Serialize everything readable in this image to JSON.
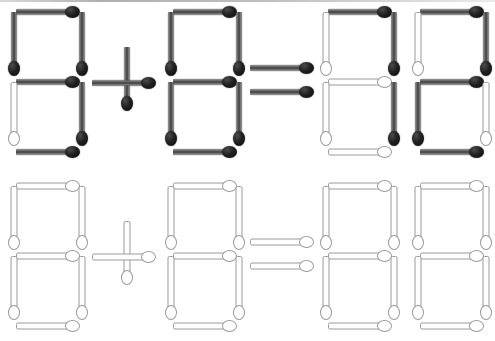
{
  "scene": {
    "title": "Matchstick arithmetic puzzle",
    "width": 495,
    "height": 341,
    "background": "#ffffff",
    "colors": {
      "lit_stick": "#3e3e3e",
      "lit_head": "#0a0a0a",
      "unlit_stick": "#ffffff",
      "unlit_outline": "#9a9a9a"
    },
    "rows": [
      {
        "name": "equation-row",
        "label": "lit equation",
        "state": "lit"
      },
      {
        "name": "blank-row",
        "label": "unlit template",
        "state": "unlit"
      }
    ],
    "equation": {
      "expression": "9 + 8 = 3 2",
      "left_operand": "9",
      "operator": "+",
      "right_operand": "8",
      "equals": "=",
      "result": "32"
    }
  },
  "geometry": {
    "seg_len": 62,
    "stick_thickness": 7,
    "head_len": 15
  },
  "digits": [
    {
      "name": "digit-1",
      "row": "top",
      "value": "9",
      "x": 10,
      "y": 8,
      "segments": {
        "top": "lit",
        "top_left": "lit",
        "top_right": "lit",
        "middle": "lit",
        "bottom_left": "unlit",
        "bottom_right": "lit",
        "bottom": "lit"
      }
    },
    {
      "name": "digit-2",
      "row": "top",
      "value": "8",
      "x": 167,
      "y": 8,
      "segments": {
        "top": "lit",
        "top_left": "lit",
        "top_right": "lit",
        "middle": "lit",
        "bottom_left": "lit",
        "bottom_right": "lit",
        "bottom": "lit"
      }
    },
    {
      "name": "digit-3",
      "row": "top",
      "value": "3",
      "x": 322,
      "y": 8,
      "segments": {
        "top": "lit",
        "top_left": "unlit",
        "top_right": "lit",
        "middle": "unlit",
        "bottom_left": "unlit",
        "bottom_right": "lit",
        "bottom": "unlit"
      }
    },
    {
      "name": "digit-4",
      "row": "top",
      "value": "2",
      "x": 414,
      "y": 8,
      "segments": {
        "top": "lit",
        "top_left": "unlit",
        "top_right": "lit",
        "middle": "lit",
        "bottom_left": "lit",
        "bottom_right": "unlit",
        "bottom": "lit"
      }
    },
    {
      "name": "digit-5",
      "row": "bottom",
      "value": "blank",
      "x": 10,
      "y": 182,
      "segments": {
        "top": "unlit",
        "top_left": "unlit",
        "top_right": "unlit",
        "middle": "unlit",
        "bottom_left": "unlit",
        "bottom_right": "unlit",
        "bottom": "unlit"
      }
    },
    {
      "name": "digit-6",
      "row": "bottom",
      "value": "blank",
      "x": 167,
      "y": 182,
      "segments": {
        "top": "unlit",
        "top_left": "unlit",
        "top_right": "unlit",
        "middle": "unlit",
        "bottom_left": "unlit",
        "bottom_right": "unlit",
        "bottom": "unlit"
      }
    },
    {
      "name": "digit-7",
      "row": "bottom",
      "value": "blank",
      "x": 322,
      "y": 182,
      "segments": {
        "top": "unlit",
        "top_left": "unlit",
        "top_right": "unlit",
        "middle": "unlit",
        "bottom_left": "unlit",
        "bottom_right": "unlit",
        "bottom": "unlit"
      }
    },
    {
      "name": "digit-8",
      "row": "bottom",
      "value": "blank",
      "x": 414,
      "y": 182,
      "segments": {
        "top": "unlit",
        "top_left": "unlit",
        "top_right": "unlit",
        "middle": "unlit",
        "bottom_left": "unlit",
        "bottom_right": "unlit",
        "bottom": "unlit"
      }
    }
  ],
  "operators": [
    {
      "name": "plus-sign-top",
      "glyph": "+",
      "row": "top",
      "state": "lit",
      "parts": [
        {
          "name": "plus-vertical-match",
          "orient": "v",
          "head": "bottom",
          "x": 119,
          "y": 47,
          "len": 62
        },
        {
          "name": "plus-horizontal-match",
          "orient": "h",
          "head": "right",
          "x": 92,
          "y": 75,
          "len": 62
        }
      ]
    },
    {
      "name": "equals-sign-top",
      "glyph": "=",
      "row": "top",
      "state": "lit",
      "parts": [
        {
          "name": "equals-upper-match",
          "orient": "h",
          "head": "right",
          "x": 250,
          "y": 60,
          "len": 62
        },
        {
          "name": "equals-lower-match",
          "orient": "h",
          "head": "right",
          "x": 250,
          "y": 84,
          "len": 62
        }
      ]
    },
    {
      "name": "plus-sign-bottom",
      "glyph": "+",
      "row": "bottom",
      "state": "unlit",
      "parts": [
        {
          "name": "plus-vertical-match",
          "orient": "v",
          "head": "bottom",
          "x": 119,
          "y": 221,
          "len": 62
        },
        {
          "name": "plus-horizontal-match",
          "orient": "h",
          "head": "right",
          "x": 92,
          "y": 249,
          "len": 62
        }
      ]
    },
    {
      "name": "equals-sign-bottom",
      "glyph": "=",
      "row": "bottom",
      "state": "unlit",
      "parts": [
        {
          "name": "equals-upper-match",
          "orient": "h",
          "head": "right",
          "x": 250,
          "y": 234,
          "len": 62
        },
        {
          "name": "equals-lower-match",
          "orient": "h",
          "head": "right",
          "x": 250,
          "y": 258,
          "len": 62
        }
      ]
    }
  ]
}
